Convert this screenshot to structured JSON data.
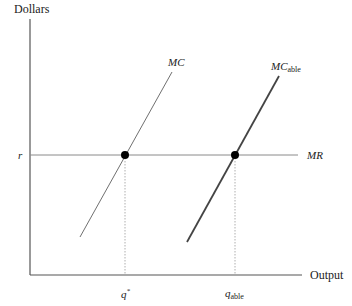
{
  "diagram": {
    "y_axis_label": "Dollars",
    "x_axis_label": "Output",
    "price_label": "r",
    "mr_label": "MR",
    "mc_label": "MC",
    "mc_able_label_main": "MC",
    "mc_able_label_sub": "able",
    "q_star_label": "q",
    "q_star_sup": "*",
    "q_able_label_main": "q",
    "q_able_label_sub": "able",
    "colors": {
      "axis": "#555555",
      "mr_line": "#8a8a8a",
      "mc_line": "#707070",
      "mc_able_line": "#444444",
      "dot": "#000000",
      "dotted_guides": "#9a9a9a"
    }
  }
}
